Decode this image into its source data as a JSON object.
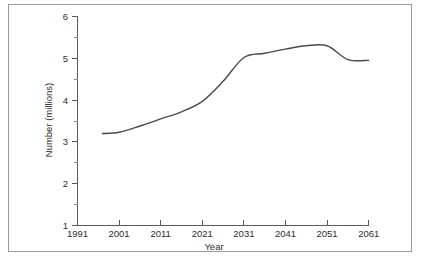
{
  "chart_data": {
    "type": "line",
    "title": "",
    "xlabel": "Year",
    "ylabel": "Number (millions)",
    "xlim": [
      1991,
      2061
    ],
    "ylim": [
      1,
      6
    ],
    "grid": false,
    "legend": "none",
    "x_ticks": [
      "1991",
      "2001",
      "2011",
      "2021",
      "2031",
      "2041",
      "2051",
      "2061"
    ],
    "x_tick_values": [
      1991,
      2001,
      2011,
      2021,
      2031,
      2041,
      2051,
      2061
    ],
    "y_ticks": [
      "1",
      "2",
      "3",
      "4",
      "5",
      "6"
    ],
    "y_tick_values": [
      1,
      2,
      3,
      4,
      5,
      6
    ],
    "y_minor_ticks": [
      1.5,
      2.5,
      3.5,
      4.5,
      5.5
    ],
    "line_color": "#4a4a4a",
    "series": [
      {
        "name": "Number (millions)",
        "x": [
          1997,
          2001,
          2006,
          2011,
          2016,
          2021,
          2026,
          2031,
          2036,
          2041,
          2046,
          2051,
          2056,
          2061
        ],
        "values": [
          3.2,
          3.23,
          3.38,
          3.55,
          3.72,
          3.97,
          4.45,
          5.02,
          5.12,
          5.22,
          5.3,
          5.3,
          4.97,
          4.95
        ]
      }
    ]
  },
  "axes": {
    "x_title": "Year",
    "y_title": "Number (millions)"
  },
  "colors": {
    "line": "#4a4a4a",
    "axis": "#5a5a5a",
    "frame": "#9a9a9a",
    "background": "#ffffff",
    "text": "#2b2b2b"
  }
}
